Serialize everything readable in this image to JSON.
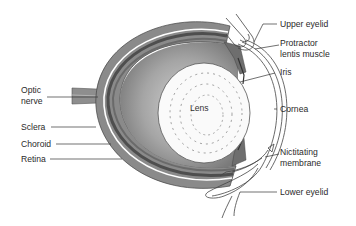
{
  "diagram": {
    "labels_left": {
      "optic_nerve_line1": "Optic",
      "optic_nerve_line2": "nerve",
      "sclera": "Sclera",
      "choroid": "Choroid",
      "retina": "Retina"
    },
    "labels_right": {
      "upper_eyelid": "Upper eyelid",
      "protractor_line1": "Protractor",
      "protractor_line2": "lentis muscle",
      "iris": "Iris",
      "cornea": "Cornea",
      "nictitating_line1": "Nictitating",
      "nictitating_line2": "membrane",
      "lower_eyelid": "Lower eyelid"
    },
    "center_label": "Lens"
  },
  "colors": {
    "background": "#ffffff",
    "sclera": "#8a8a8a",
    "choroid": "#5a5a5a",
    "vitreous": "#a8a8a8",
    "lens": "#fbfbfb",
    "lines": "#333333"
  }
}
